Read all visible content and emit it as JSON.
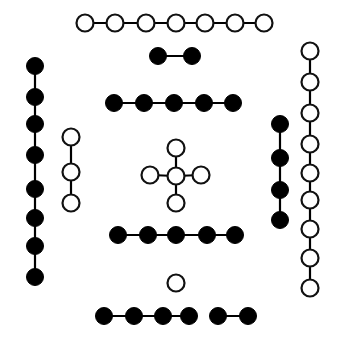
{
  "figure": {
    "title": "",
    "width": 340,
    "height": 338,
    "background_color": "#ffffff",
    "open_node_fill": "#ffffff",
    "open_node_stroke": "#111111",
    "filled_node_fill": "#000000",
    "edge_color": "#000000",
    "node_radius_open": 8.5,
    "node_radius_filled": 8.5,
    "open_stroke_width": 2.2,
    "edge_stroke_width": 2.2
  },
  "chart_data": {
    "type": "diagram",
    "node_types": [
      "open",
      "filled"
    ],
    "components": [
      {
        "id": "top-open-path",
        "label": "top horizontal open path",
        "node_type": "open",
        "node_count": 7,
        "orientation": "horizontal",
        "nodes": [
          {
            "x": 85,
            "y": 23
          },
          {
            "x": 115,
            "y": 23
          },
          {
            "x": 146,
            "y": 23
          },
          {
            "x": 176,
            "y": 23
          },
          {
            "x": 205,
            "y": 23
          },
          {
            "x": 235,
            "y": 23
          },
          {
            "x": 264,
            "y": 23
          }
        ],
        "edges": [
          [
            0,
            1
          ],
          [
            1,
            2
          ],
          [
            2,
            3
          ],
          [
            3,
            4
          ],
          [
            4,
            5
          ],
          [
            5,
            6
          ]
        ]
      },
      {
        "id": "upper-filled-pair",
        "label": "upper filled two-node edge",
        "node_type": "filled",
        "node_count": 2,
        "orientation": "horizontal",
        "nodes": [
          {
            "x": 158,
            "y": 56
          },
          {
            "x": 192,
            "y": 56
          }
        ],
        "edges": [
          [
            0,
            1
          ]
        ]
      },
      {
        "id": "upper-filled-path",
        "label": "upper horizontal filled path",
        "node_type": "filled",
        "node_count": 5,
        "orientation": "horizontal",
        "nodes": [
          {
            "x": 114,
            "y": 103
          },
          {
            "x": 144,
            "y": 103
          },
          {
            "x": 174,
            "y": 103
          },
          {
            "x": 204,
            "y": 103
          },
          {
            "x": 233,
            "y": 103
          }
        ],
        "edges": [
          [
            0,
            1
          ],
          [
            1,
            2
          ],
          [
            2,
            3
          ],
          [
            3,
            4
          ]
        ]
      },
      {
        "id": "left-filled-column",
        "label": "left vertical filled path",
        "node_type": "filled",
        "node_count": 8,
        "orientation": "vertical",
        "nodes": [
          {
            "x": 35,
            "y": 66
          },
          {
            "x": 35,
            "y": 97
          },
          {
            "x": 35,
            "y": 124
          },
          {
            "x": 35,
            "y": 155
          },
          {
            "x": 35,
            "y": 189
          },
          {
            "x": 35,
            "y": 218
          },
          {
            "x": 35,
            "y": 246
          },
          {
            "x": 35,
            "y": 277
          }
        ],
        "edges": [
          [
            0,
            1
          ],
          [
            1,
            2
          ],
          [
            2,
            3
          ],
          [
            3,
            4
          ],
          [
            4,
            5
          ],
          [
            5,
            6
          ],
          [
            6,
            7
          ]
        ]
      },
      {
        "id": "left-open-column",
        "label": "inner left vertical open path",
        "node_type": "open",
        "node_count": 3,
        "orientation": "vertical",
        "nodes": [
          {
            "x": 71,
            "y": 137
          },
          {
            "x": 71,
            "y": 172
          },
          {
            "x": 71,
            "y": 203
          }
        ],
        "edges": [
          [
            0,
            1
          ],
          [
            1,
            2
          ]
        ]
      },
      {
        "id": "center-star",
        "label": "central star with four open leaves",
        "node_type": "open",
        "node_count": 5,
        "orientation": "star",
        "nodes": [
          {
            "x": 176,
            "y": 176,
            "role": "center"
          },
          {
            "x": 176,
            "y": 148,
            "role": "top-leaf"
          },
          {
            "x": 176,
            "y": 203,
            "role": "bottom-leaf"
          },
          {
            "x": 150,
            "y": 175,
            "role": "left-leaf"
          },
          {
            "x": 201,
            "y": 175,
            "role": "right-leaf"
          }
        ],
        "edges": [
          [
            0,
            1
          ],
          [
            0,
            2
          ],
          [
            0,
            3
          ],
          [
            0,
            4
          ]
        ]
      },
      {
        "id": "right-filled-column",
        "label": "inner right vertical filled path",
        "node_type": "filled",
        "node_count": 4,
        "orientation": "vertical",
        "nodes": [
          {
            "x": 280,
            "y": 124
          },
          {
            "x": 280,
            "y": 158
          },
          {
            "x": 280,
            "y": 190
          },
          {
            "x": 280,
            "y": 220
          }
        ],
        "edges": [
          [
            0,
            1
          ],
          [
            1,
            2
          ],
          [
            2,
            3
          ]
        ]
      },
      {
        "id": "right-open-column",
        "label": "right vertical open path",
        "node_type": "open",
        "node_count": 9,
        "orientation": "vertical",
        "nodes": [
          {
            "x": 310,
            "y": 51
          },
          {
            "x": 310,
            "y": 82
          },
          {
            "x": 310,
            "y": 113
          },
          {
            "x": 310,
            "y": 144
          },
          {
            "x": 310,
            "y": 173
          },
          {
            "x": 310,
            "y": 200
          },
          {
            "x": 310,
            "y": 229
          },
          {
            "x": 310,
            "y": 258
          },
          {
            "x": 310,
            "y": 288
          }
        ],
        "edges": [
          [
            0,
            1
          ],
          [
            1,
            2
          ],
          [
            2,
            3
          ],
          [
            3,
            4
          ],
          [
            4,
            5
          ],
          [
            5,
            6
          ],
          [
            6,
            7
          ],
          [
            7,
            8
          ]
        ]
      },
      {
        "id": "lower-filled-path",
        "label": "lower horizontal filled path",
        "node_type": "filled",
        "node_count": 5,
        "orientation": "horizontal",
        "nodes": [
          {
            "x": 118,
            "y": 235
          },
          {
            "x": 148,
            "y": 235
          },
          {
            "x": 176,
            "y": 235
          },
          {
            "x": 207,
            "y": 235
          },
          {
            "x": 235,
            "y": 235
          }
        ],
        "edges": [
          [
            0,
            1
          ],
          [
            1,
            2
          ],
          [
            2,
            3
          ],
          [
            3,
            4
          ]
        ]
      },
      {
        "id": "isolated-open-node",
        "label": "isolated open node",
        "node_type": "open",
        "node_count": 1,
        "orientation": "point",
        "nodes": [
          {
            "x": 176,
            "y": 283
          }
        ],
        "edges": []
      },
      {
        "id": "bottom-filled-path-a",
        "label": "bottom horizontal filled path, left segment",
        "node_type": "filled",
        "node_count": 4,
        "orientation": "horizontal",
        "nodes": [
          {
            "x": 104,
            "y": 316
          },
          {
            "x": 134,
            "y": 316
          },
          {
            "x": 163,
            "y": 316
          },
          {
            "x": 189,
            "y": 316
          }
        ],
        "edges": [
          [
            0,
            1
          ],
          [
            1,
            2
          ],
          [
            2,
            3
          ]
        ]
      },
      {
        "id": "bottom-filled-path-b",
        "label": "bottom horizontal filled path, right segment",
        "node_type": "filled",
        "node_count": 2,
        "orientation": "horizontal",
        "nodes": [
          {
            "x": 218,
            "y": 316
          },
          {
            "x": 248,
            "y": 316
          }
        ],
        "edges": [
          [
            0,
            1
          ]
        ]
      }
    ],
    "totals": {
      "components": 12,
      "open_nodes": 25,
      "filled_nodes": 30,
      "total_nodes": 55
    }
  }
}
